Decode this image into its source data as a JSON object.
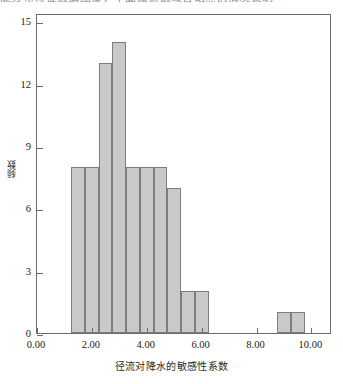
{
  "page_bleed_text": "能分布特征数据图像，下面是该区域各站点的情况说明",
  "chart_data": {
    "type": "bar",
    "title": "",
    "subtitle": "",
    "xlabel": "径流对降水的敏感性系数",
    "ylabel": "频数",
    "xlim": [
      0.0,
      10.75
    ],
    "ylim": [
      0,
      15.4
    ],
    "grid": false,
    "legend": null,
    "bin_width": 0.5,
    "categories": [
      "1.25-1.75",
      "1.75-2.25",
      "2.25-2.75",
      "2.75-3.25",
      "3.25-3.75",
      "3.75-4.25",
      "4.25-4.75",
      "4.75-5.25",
      "5.25-5.75",
      "5.75-6.25",
      "8.75-9.25",
      "9.25-9.75"
    ],
    "bin_starts": [
      1.25,
      1.75,
      2.25,
      2.75,
      3.25,
      3.75,
      4.25,
      4.75,
      5.25,
      5.75,
      8.75,
      9.25
    ],
    "values": [
      8,
      8,
      13,
      14,
      8,
      8,
      8,
      7,
      2,
      2,
      1,
      1
    ],
    "y_ticks": [
      0,
      3,
      6,
      9,
      12,
      15
    ],
    "y_tick_labels": [
      "0",
      "3",
      "6",
      "9",
      "12",
      "15"
    ],
    "x_ticks": [
      0.0,
      2.0,
      4.0,
      6.0,
      8.0,
      10.0
    ],
    "x_tick_labels": [
      "0.00",
      "2.00",
      "4.00",
      "6.00",
      "8.00",
      "10.00"
    ],
    "bar_fill_color": "#c9c9c9",
    "bar_edge_color": "#7d7d7d",
    "axis_color": "#6b6b6b"
  }
}
